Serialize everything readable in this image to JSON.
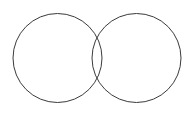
{
  "figure": {
    "background_color": "#ffffff",
    "width": 196,
    "height": 113
  },
  "chart_data": {
    "type": "diagram",
    "subtype": "venn-two-set",
    "title": "",
    "shapes": [
      {
        "name": "left-circle",
        "shape": "circle",
        "cx": 57.5,
        "cy": 58,
        "r": 44.5,
        "stroke": "#3a3a3a",
        "stroke_width": 1,
        "fill": "none",
        "label": ""
      },
      {
        "name": "right-circle",
        "shape": "circle",
        "cx": 136.5,
        "cy": 58,
        "r": 44.5,
        "stroke": "#3a3a3a",
        "stroke_width": 1,
        "fill": "none",
        "label": ""
      }
    ],
    "intersection": {
      "name": "lens-region",
      "upper_crossing": [
        97,
        27
      ],
      "lower_crossing": [
        97,
        88
      ],
      "width": 10,
      "label": ""
    },
    "center_distance": 79,
    "labels": [],
    "legend": null,
    "grid": false
  }
}
